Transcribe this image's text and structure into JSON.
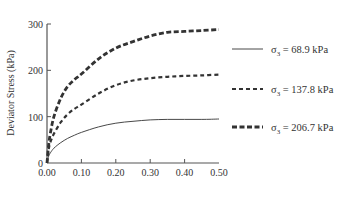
{
  "chart_data": {
    "type": "line",
    "title": "",
    "xlabel": "",
    "ylabel": "Deviator Stress (kPa)",
    "xlim": [
      0,
      0.5
    ],
    "ylim": [
      0,
      300
    ],
    "x_ticks": [
      "0.00",
      "0.10",
      "0.20",
      "0.30",
      "0.40",
      "0.50"
    ],
    "y_ticks": [
      "0",
      "100",
      "200",
      "300"
    ],
    "grid": false,
    "legend_position": "right",
    "series": [
      {
        "name": "σ3 = 68.9 kPa",
        "style": "solid",
        "x": [
          0,
          0.005,
          0.01,
          0.02,
          0.04,
          0.06,
          0.08,
          0.1,
          0.15,
          0.2,
          0.25,
          0.3,
          0.35,
          0.4,
          0.45,
          0.5
        ],
        "values": [
          0,
          15,
          22,
          32,
          44,
          53,
          60,
          66,
          78,
          86,
          90,
          93,
          94,
          94,
          94,
          95
        ]
      },
      {
        "name": "σ3 = 137.8 kPa",
        "style": "dashed",
        "x": [
          0,
          0.005,
          0.01,
          0.02,
          0.04,
          0.06,
          0.08,
          0.1,
          0.15,
          0.2,
          0.25,
          0.3,
          0.35,
          0.4,
          0.45,
          0.5
        ],
        "values": [
          0,
          30,
          45,
          63,
          88,
          105,
          117,
          126,
          150,
          168,
          178,
          183,
          186,
          188,
          189,
          191
        ]
      },
      {
        "name": "σ3 = 206.7 kPa",
        "style": "dashed-bold",
        "x": [
          0,
          0.005,
          0.01,
          0.02,
          0.04,
          0.06,
          0.08,
          0.1,
          0.15,
          0.2,
          0.25,
          0.3,
          0.35,
          0.4,
          0.45,
          0.5
        ],
        "values": [
          0,
          40,
          65,
          100,
          140,
          165,
          180,
          192,
          225,
          248,
          262,
          274,
          282,
          284,
          286,
          288
        ]
      }
    ]
  },
  "legend": {
    "items": [
      {
        "prefix": "σ",
        "sub": "3",
        "suffix": " = 68.9 kPa"
      },
      {
        "prefix": "σ",
        "sub": "3",
        "suffix": " = 137.8 kPa"
      },
      {
        "prefix": "σ",
        "sub": "3",
        "suffix": " = 206.7 kPa"
      }
    ]
  },
  "colors": {
    "axis": "#555555",
    "line": "#333333",
    "text": "#333333"
  }
}
